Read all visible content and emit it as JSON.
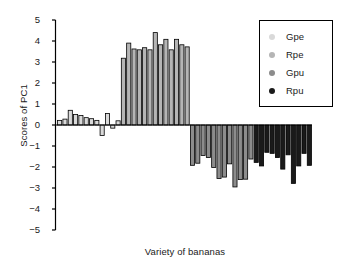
{
  "chart_data": {
    "type": "bar",
    "title": "",
    "xlabel": "Variety of bananas",
    "ylabel": "Scores of PC1",
    "ylim": [
      -5,
      5
    ],
    "yticks": [
      5,
      4,
      3,
      2,
      1,
      0,
      -1,
      -2,
      -3,
      -4,
      -5
    ],
    "ytick_labels": [
      "5",
      "4",
      "3",
      "2",
      "1",
      "0",
      "−1",
      "−2",
      "−3",
      "−4",
      "−5"
    ],
    "grid": false,
    "legend_position": "top-right",
    "xtick_labels": [],
    "series": [
      {
        "name": "Gpe",
        "color": "#d9d9d9",
        "values": [
          0.22,
          0.28,
          0.7,
          0.5,
          0.45,
          0.35,
          0.3,
          0.22,
          -0.5,
          0.55,
          -0.15,
          0.2
        ]
      },
      {
        "name": "Rpe",
        "color": "#b5b5b5",
        "values": [
          3.18,
          3.9,
          3.62,
          3.58,
          3.68,
          3.58,
          4.4,
          3.82,
          4.08,
          3.58,
          4.08,
          3.82,
          3.72
        ]
      },
      {
        "name": "Gpu",
        "color": "#8c8c8c",
        "values": [
          -1.92,
          -1.82,
          -1.45,
          -1.55,
          -2.02,
          -2.55,
          -2.48,
          -1.85,
          -2.95,
          -2.6,
          -2.58,
          -1.62
        ]
      },
      {
        "name": "Rpu",
        "color": "#1a1a1a",
        "values": [
          -1.78,
          -1.95,
          -1.3,
          -1.35,
          -1.55,
          -2.1,
          -1.42,
          -2.78,
          -1.95,
          -1.35,
          -1.92
        ]
      }
    ]
  },
  "legend": {
    "entries": [
      {
        "label": "Gpe",
        "color": "#d9d9d9"
      },
      {
        "label": "Rpe",
        "color": "#b5b5b5"
      },
      {
        "label": "Gpu",
        "color": "#8c8c8c"
      },
      {
        "label": "Rpu",
        "color": "#1a1a1a"
      }
    ]
  },
  "axes": {
    "y_label": "Scores of PC1",
    "x_label": "Variety of bananas"
  }
}
